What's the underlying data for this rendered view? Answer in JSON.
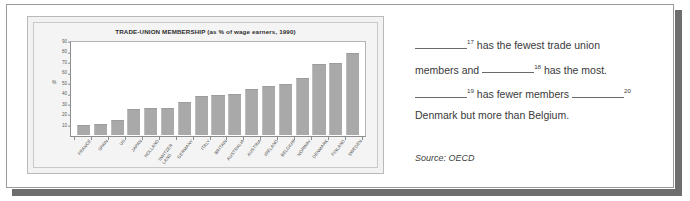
{
  "chart_data": {
    "type": "bar",
    "title": "TRADE-UNION MEMBERSHIP (as % of wage earners, 1990)",
    "xlabel": "",
    "ylabel": "%",
    "ylim": [
      0,
      90
    ],
    "yticks": [
      90,
      80,
      70,
      60,
      50,
      40,
      30,
      20,
      10
    ],
    "grid": false,
    "legend": "none",
    "bar_color": "#a9a9a9",
    "plot_background": "#ffffff",
    "categories": [
      "FRANCE",
      "SPAIN",
      "US",
      "JAPAN",
      "HOLLAND",
      "SWITZER LAND",
      "GERMANY",
      "ITALY",
      "BRITAIN",
      "AUSTRALIA",
      "AUSTRIA",
      "IRELAND",
      "BELGIUM",
      "NORWAY",
      "DENMARK",
      "FINLAND",
      "SWEDEN"
    ],
    "values": [
      10,
      11,
      15,
      25,
      26,
      26,
      32,
      38,
      39,
      40,
      45,
      48,
      50,
      56,
      69,
      70,
      80
    ],
    "source": "Source: OECD"
  },
  "exercise": {
    "lines": [
      {
        "segments": [
          {
            "type": "blank"
          },
          {
            "type": "sup",
            "text": "17"
          },
          {
            "type": "text",
            "text": " has the fewest trade union"
          }
        ]
      },
      {
        "segments": [
          {
            "type": "text",
            "text": "members and "
          },
          {
            "type": "blank"
          },
          {
            "type": "sup",
            "text": "18"
          },
          {
            "type": "text",
            "text": " has the most."
          }
        ]
      },
      {
        "segments": [
          {
            "type": "blank"
          },
          {
            "type": "sup",
            "text": "19"
          },
          {
            "type": "text",
            "text": " has fewer members "
          },
          {
            "type": "blank"
          },
          {
            "type": "sup",
            "text": "20"
          }
        ]
      },
      {
        "segments": [
          {
            "type": "text",
            "text": "Denmark but more than Belgium."
          }
        ]
      }
    ],
    "line1_sup": "17",
    "line1_text": " has the fewest trade union",
    "line2_pre": "members and ",
    "line2_sup": "18",
    "line2_post": " has the most.",
    "line3_sup": "19",
    "line3_mid": " has fewer members ",
    "line3_sup2": "20",
    "line4_text": "Denmark but more than Belgium."
  },
  "source_note": "Source: OECD"
}
